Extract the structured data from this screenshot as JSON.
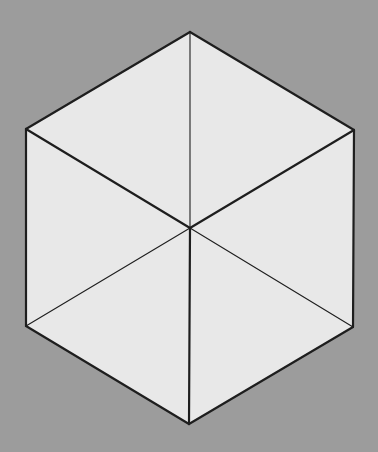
{
  "figure": {
    "background_color": "#9c9c9c",
    "face_color": "#e8e8e8",
    "stroke_color": "#1e1e1e",
    "vertices": {
      "top": [
        190,
        32
      ],
      "upper_left": [
        26,
        129
      ],
      "upper_right": [
        354,
        130
      ],
      "center": [
        190,
        228
      ],
      "lower_left": [
        26,
        326
      ],
      "lower_right": [
        353,
        327
      ],
      "bottom": [
        189,
        424
      ]
    },
    "thick_lines": [
      [
        "top",
        "upper_right"
      ],
      [
        "upper_right",
        "lower_right"
      ],
      [
        "lower_right",
        "bottom"
      ],
      [
        "bottom",
        "lower_left"
      ],
      [
        "lower_left",
        "upper_left"
      ],
      [
        "upper_left",
        "top"
      ],
      [
        "center",
        "upper_left"
      ],
      [
        "center",
        "upper_right"
      ],
      [
        "center",
        "bottom"
      ]
    ],
    "thin_lines": [
      [
        "center",
        "top"
      ],
      [
        "center",
        "lower_left"
      ],
      [
        "center",
        "lower_right"
      ]
    ]
  }
}
